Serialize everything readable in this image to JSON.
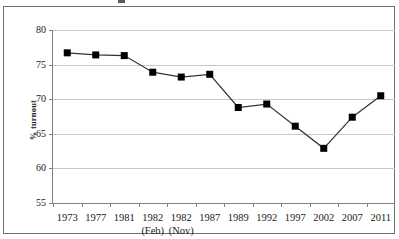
{
  "chart_data": {
    "type": "line",
    "title": "",
    "xlabel": "",
    "ylabel": "% turnout",
    "ylim": [
      55,
      80
    ],
    "yticks": [
      55,
      60,
      65,
      70,
      75,
      80
    ],
    "ytick_labels": [
      "55",
      "60",
      "65",
      "70",
      "75",
      "80"
    ],
    "grid": true,
    "legend": false,
    "legend_position": "none",
    "marker": "square",
    "marker_color": "#000000",
    "line_color": "#333333",
    "categories": [
      "1973",
      "1977",
      "1981",
      "1982",
      "1982",
      "1987",
      "1989",
      "1992",
      "1997",
      "2002",
      "2007",
      "2011"
    ],
    "category_sublabels": [
      "",
      "",
      "",
      "(Feb)",
      "(Nov)",
      "",
      "",
      "",
      "",
      "",
      "",
      ""
    ],
    "values": [
      76.7,
      76.4,
      76.3,
      73.9,
      73.2,
      73.6,
      68.8,
      69.3,
      66.1,
      62.9,
      67.4,
      70.5
    ],
    "series": [
      {
        "name": "% turnout",
        "values": [
          76.7,
          76.4,
          76.3,
          73.9,
          73.2,
          73.6,
          68.8,
          69.3,
          66.1,
          62.9,
          67.4,
          70.5
        ]
      }
    ]
  },
  "colors": {
    "grid": "#c8c8c8",
    "axis": "#808080",
    "frame": "#6f6f6f",
    "marker": "#000000",
    "line": "#333333",
    "text": "#1a1a1a",
    "background": "#ffffff"
  }
}
